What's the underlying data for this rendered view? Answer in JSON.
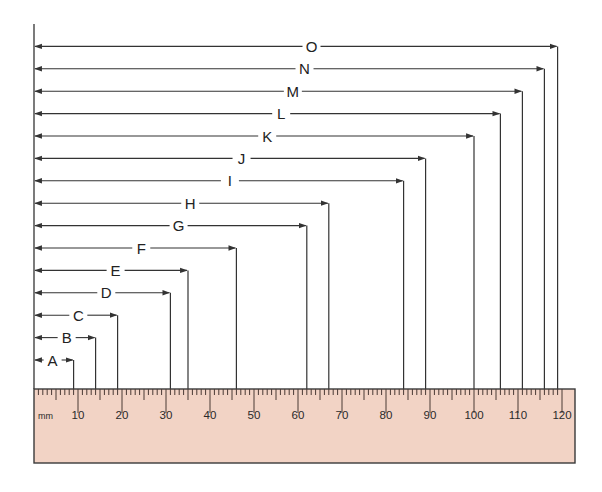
{
  "diagram": {
    "type": "ruler-measurement-diagram",
    "unit": "mm",
    "ruler": {
      "unit_label": "mm",
      "min": 0,
      "max": 120,
      "major_every": 10,
      "mid_every": 5,
      "labels": [
        "10",
        "20",
        "30",
        "40",
        "50",
        "60",
        "70",
        "80",
        "90",
        "100",
        "110",
        "120"
      ],
      "color": "#f2d3c5",
      "border_color": "#3a3a3a"
    },
    "measurements": [
      {
        "label": "A",
        "value_mm": 9
      },
      {
        "label": "B",
        "value_mm": 14
      },
      {
        "label": "C",
        "value_mm": 19
      },
      {
        "label": "D",
        "value_mm": 31
      },
      {
        "label": "E",
        "value_mm": 35
      },
      {
        "label": "F",
        "value_mm": 46
      },
      {
        "label": "G",
        "value_mm": 62
      },
      {
        "label": "H",
        "value_mm": 67
      },
      {
        "label": "I",
        "value_mm": 84
      },
      {
        "label": "J",
        "value_mm": 89
      },
      {
        "label": "K",
        "value_mm": 100
      },
      {
        "label": "L",
        "value_mm": 106
      },
      {
        "label": "M",
        "value_mm": 111
      },
      {
        "label": "N",
        "value_mm": 116
      },
      {
        "label": "O",
        "value_mm": 119
      }
    ],
    "line_color": "#333333"
  }
}
